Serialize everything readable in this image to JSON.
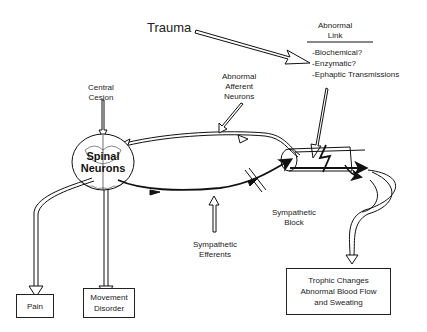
{
  "labels": {
    "trauma": "Trauma",
    "abnormal_link_title_1": "Abnormal",
    "abnormal_link_title_2": "Link",
    "abnormal_link_items": [
      "-Biochemical?",
      "-Enzymatic?",
      "-Ephaptic Transmissions"
    ],
    "central_lesion_1": "Central",
    "central_lesion_2": "Cesion",
    "abnormal_afferent_1": "Abnormal",
    "abnormal_afferent_2": "Afferent",
    "abnormal_afferent_3": "Neurons",
    "spinal_neurons_1": "Spinal",
    "spinal_neurons_2": "Neurons",
    "sympathetic_block_1": "Sympathetic",
    "sympathetic_block_2": "Block",
    "sympathetic_efferents_1": "Sympathetic",
    "sympathetic_efferents_2": "Efferents"
  },
  "boxes": {
    "pain": "Pain",
    "movement_1": "Movement",
    "movement_2": "Disorder",
    "trophic_1": "Trophic Changes",
    "trophic_2": "Abnormal Blood Flow",
    "trophic_3": "and Sweating"
  },
  "colors": {
    "line": "#111111",
    "background": "#ffffff"
  }
}
